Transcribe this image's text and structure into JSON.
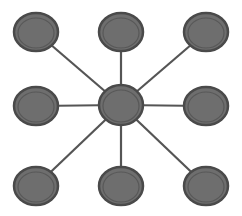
{
  "diagram": {
    "type": "hub-and-spoke",
    "colors": {
      "background": "#ffffff",
      "node_fill": "#6e6e6e",
      "node_outer_ring": "#4a4a4a",
      "node_inner_ring": "#585858",
      "edge": "#555555"
    },
    "hub": {
      "id": "center",
      "x": 121,
      "y": 105,
      "rx": 22,
      "ry": 20
    },
    "nodes": [
      {
        "id": "top-left",
        "x": 36,
        "y": 32,
        "rx": 22,
        "ry": 19
      },
      {
        "id": "top-center",
        "x": 121,
        "y": 32,
        "rx": 22,
        "ry": 19
      },
      {
        "id": "top-right",
        "x": 206,
        "y": 32,
        "rx": 22,
        "ry": 19
      },
      {
        "id": "middle-left",
        "x": 36,
        "y": 106,
        "rx": 22,
        "ry": 19
      },
      {
        "id": "middle-right",
        "x": 206,
        "y": 106,
        "rx": 22,
        "ry": 19
      },
      {
        "id": "bottom-left",
        "x": 36,
        "y": 186,
        "rx": 22,
        "ry": 19
      },
      {
        "id": "bottom-center",
        "x": 121,
        "y": 186,
        "rx": 22,
        "ry": 19
      },
      {
        "id": "bottom-right",
        "x": 206,
        "y": 186,
        "rx": 22,
        "ry": 19
      }
    ],
    "edges": [
      {
        "from": "center",
        "to": "top-left"
      },
      {
        "from": "center",
        "to": "top-center"
      },
      {
        "from": "center",
        "to": "top-right"
      },
      {
        "from": "center",
        "to": "middle-left"
      },
      {
        "from": "center",
        "to": "middle-right"
      },
      {
        "from": "center",
        "to": "bottom-left"
      },
      {
        "from": "center",
        "to": "bottom-center"
      },
      {
        "from": "center",
        "to": "bottom-right"
      }
    ]
  }
}
